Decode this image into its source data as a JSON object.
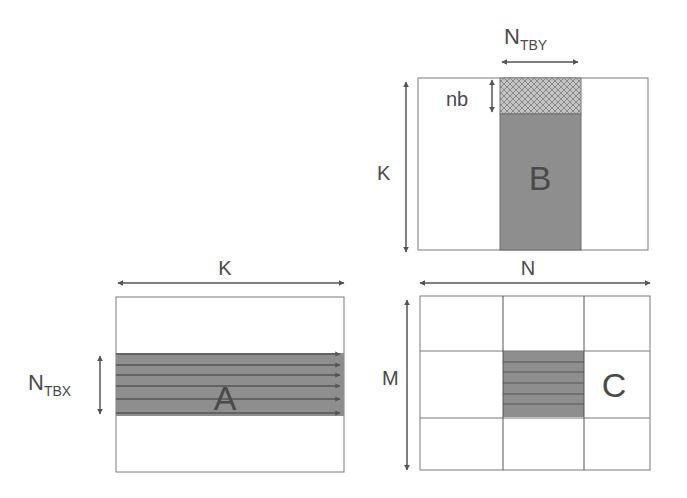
{
  "diagram": {
    "type": "matrix-multiplication-tiling",
    "colors": {
      "shaded": "#8e8e8e",
      "hatched": "#b0b0b0",
      "border": "#7a7a7a",
      "arrow": "#555555",
      "text": "#4a4a4a"
    },
    "matrix_b": {
      "name": "B",
      "top_label": "N",
      "top_label_sub": "TBY",
      "left_label": "K",
      "block_label": "nb"
    },
    "matrix_a": {
      "name": "A",
      "top_label": "K",
      "left_label": "N",
      "left_label_sub": "TBX",
      "row_lines": 6
    },
    "matrix_c": {
      "name": "C",
      "top_label": "N",
      "left_label": "M",
      "grid": "3x3",
      "shaded_cell": "center",
      "row_lines": 5
    }
  }
}
